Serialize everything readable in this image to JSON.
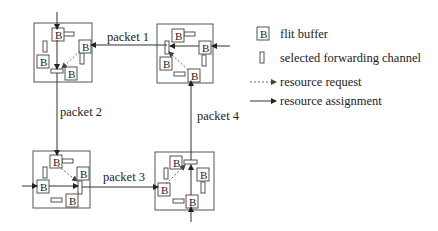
{
  "colors": {
    "stroke": "#555555",
    "line": "#333333",
    "dashed": "#888888",
    "text": "#222222"
  },
  "buffer_label": "B",
  "nodes": [
    {
      "id": "node-top-left",
      "box": [
        34,
        23,
        58,
        59
      ],
      "buffers": [
        [
          52,
          28
        ],
        [
          79,
          40
        ],
        [
          37,
          55
        ],
        [
          65,
          67
        ]
      ],
      "channels": [
        {
          "x": 63,
          "y": 32,
          "w": 11,
          "h": 4
        },
        {
          "x": 43,
          "y": 41,
          "w": 4,
          "h": 11
        },
        {
          "x": 80,
          "y": 53,
          "w": 4,
          "h": 11
        },
        {
          "x": 51,
          "y": 69,
          "w": 12,
          "h": 4,
          "selected": true
        }
      ]
    },
    {
      "id": "node-top-right",
      "box": [
        157,
        24,
        56,
        59
      ],
      "buffers": [
        [
          172,
          29
        ],
        [
          199,
          41
        ],
        [
          160,
          57
        ],
        [
          188,
          69
        ]
      ],
      "channels": [
        {
          "x": 184,
          "y": 32,
          "w": 11,
          "h": 4
        },
        {
          "x": 165,
          "y": 41,
          "w": 4,
          "h": 13,
          "selected": true
        },
        {
          "x": 202,
          "y": 55,
          "w": 4,
          "h": 11
        },
        {
          "x": 174,
          "y": 72,
          "w": 11,
          "h": 4
        }
      ]
    },
    {
      "id": "node-bottom-left",
      "box": [
        33,
        151,
        57,
        57
      ],
      "buffers": [
        [
          50,
          155
        ],
        [
          77,
          167
        ],
        [
          37,
          180
        ],
        [
          66,
          194
        ]
      ],
      "channels": [
        {
          "x": 62,
          "y": 159,
          "w": 11,
          "h": 4
        },
        {
          "x": 43,
          "y": 167,
          "w": 4,
          "h": 11
        },
        {
          "x": 78,
          "y": 181,
          "w": 4,
          "h": 13,
          "selected": true
        },
        {
          "x": 51,
          "y": 198,
          "w": 11,
          "h": 4
        }
      ]
    },
    {
      "id": "node-bottom-right",
      "box": [
        155,
        152,
        59,
        58
      ],
      "buffers": [
        [
          170,
          156
        ],
        [
          197,
          168
        ],
        [
          158,
          183
        ],
        [
          186,
          195
        ]
      ],
      "channels": [
        {
          "x": 184,
          "y": 160,
          "w": 13,
          "h": 4,
          "selected": true
        },
        {
          "x": 164,
          "y": 168,
          "w": 4,
          "h": 11
        },
        {
          "x": 201,
          "y": 182,
          "w": 4,
          "h": 11
        },
        {
          "x": 173,
          "y": 199,
          "w": 11,
          "h": 4
        }
      ]
    }
  ],
  "packets": [
    {
      "label": "packet 1",
      "label_pos": [
        107,
        41
      ]
    },
    {
      "label": "packet 2",
      "label_pos": [
        60,
        116
      ]
    },
    {
      "label": "packet 3",
      "label_pos": [
        103,
        180
      ]
    },
    {
      "label": "packet 4",
      "label_pos": [
        197,
        120
      ]
    }
  ],
  "legend": {
    "items": [
      {
        "icon": "buffer",
        "label": "flit buffer",
        "y": 34
      },
      {
        "icon": "channel",
        "label": "selected forwarding channel",
        "y": 58
      },
      {
        "icon": "dashed-arrow",
        "label": "resource request",
        "y": 82
      },
      {
        "icon": "solid-arrow",
        "label": "resource assignment",
        "y": 101
      }
    ],
    "text_x": 280
  }
}
